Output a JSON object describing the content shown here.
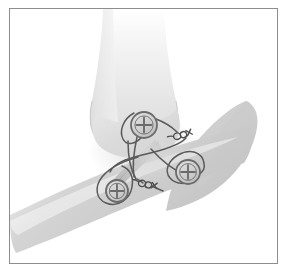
{
  "figure": {
    "title": "Suture anchor repair of joint with three anchors and knotted sutures",
    "caption": "",
    "frame": {
      "border_color": "#8d8d8d",
      "background_color": "#ffffff",
      "border_width_px": 1
    }
  },
  "palette": {
    "background": "#ffffff",
    "bone_light": "#e9e9e9",
    "bone_mid": "#d5d5d5",
    "bone_shadow": "#c2c2c2",
    "bone_outline": "#bdbdbd",
    "soft_tissue": "#c8c8c8",
    "tendon_band": "#b4b4b4",
    "suture_thread": "#5a5a5a",
    "anchor_ring": "#6b6b6b",
    "anchor_fill": "#cfcfcf",
    "anchor_cross": "#6b6b6b",
    "knot_stroke": "#4f4f4f"
  },
  "anatomy": {
    "structures": [
      {
        "name": "femur-distal",
        "label": "Distal femur",
        "fill": "#e4e4e4",
        "role": "upper-bone"
      },
      {
        "name": "femoral-condyle",
        "label": "Femoral condyle",
        "fill": "#dcdcdc",
        "role": "joint-surface"
      },
      {
        "name": "tibia-proximal",
        "label": "Proximal tibia",
        "fill": "#cccccc",
        "role": "lower-bone"
      },
      {
        "name": "tibial-shaft",
        "label": "Tibial shaft",
        "fill": "#d8d8d8",
        "role": "lower-bone-shaft"
      },
      {
        "name": "tendon-band",
        "label": "Tendon band",
        "fill": "#b2b2b2",
        "role": "soft-tissue"
      }
    ]
  },
  "hardware": {
    "anchor_count": 3,
    "knot_count": 2,
    "anchors": [
      {
        "name": "anchor-superior",
        "label": "Superior suture anchor",
        "cx": 134,
        "cy": 116,
        "r": 13,
        "position": "upper-center"
      },
      {
        "name": "anchor-inferior-right",
        "label": "Inferior-lateral suture anchor",
        "cx": 178,
        "cy": 163,
        "r": 12,
        "position": "lower-right"
      },
      {
        "name": "anchor-inferior-left",
        "label": "Inferior-medial suture anchor",
        "cx": 107,
        "cy": 182,
        "r": 11,
        "position": "lower-left"
      }
    ],
    "knots": [
      {
        "name": "knot-upper-right",
        "label": "Upper suture knot",
        "cx": 171,
        "cy": 126,
        "angle_deg": -18
      },
      {
        "name": "knot-lower-center",
        "label": "Lower suture knot",
        "cx": 136,
        "cy": 175,
        "angle_deg": 8
      }
    ],
    "sutures": [
      {
        "name": "suture-loop-superior",
        "label": "Superior anchor loop"
      },
      {
        "name": "suture-loop-inferior-right",
        "label": "Lateral anchor loop"
      },
      {
        "name": "suture-loop-inferior-left",
        "label": "Medial anchor loop"
      },
      {
        "name": "suture-limb-crossing",
        "label": "Crossing suture limbs"
      }
    ]
  }
}
